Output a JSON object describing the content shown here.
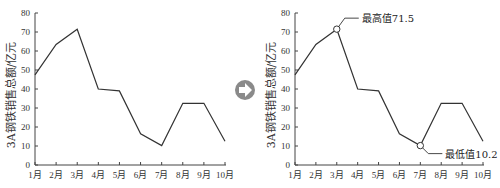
{
  "arrow_icon": {
    "name": "arrow-right-circle-icon",
    "color": "#8a8a8a"
  },
  "chart_data": [
    {
      "type": "line",
      "title": "",
      "xlabel": "",
      "ylabel": "3A钢铁销售总额/亿元",
      "categories": [
        "1月",
        "2月",
        "3月",
        "4月",
        "5月",
        "6月",
        "7月",
        "8月",
        "9月",
        "10月"
      ],
      "values": [
        47.5,
        63.5,
        71.5,
        40,
        39,
        16.5,
        10.2,
        32.5,
        32.5,
        12.5
      ],
      "yticks": [
        0,
        10,
        20,
        30,
        40,
        50,
        60,
        70,
        80
      ],
      "ylim": [
        0,
        80
      ],
      "grid": false,
      "line_color": "#333333",
      "annotations": []
    },
    {
      "type": "line",
      "title": "",
      "xlabel": "",
      "ylabel": "3A钢铁销售总额/亿元",
      "categories": [
        "1月",
        "2月",
        "3月",
        "4月",
        "5月",
        "6月",
        "7月",
        "8月",
        "9月",
        "10月"
      ],
      "values": [
        47.5,
        63.5,
        71.5,
        40,
        39,
        16.5,
        10.2,
        32.5,
        32.5,
        12.5
      ],
      "yticks": [
        0,
        10,
        20,
        30,
        40,
        50,
        60,
        70,
        80
      ],
      "ylim": [
        0,
        80
      ],
      "grid": false,
      "line_color": "#333333",
      "annotations": [
        {
          "label": "最高值71.5",
          "category": "3月",
          "value": 71.5,
          "marker": "hollow-circle"
        },
        {
          "label": "最低值10.2",
          "category": "7月",
          "value": 10.2,
          "marker": "hollow-circle"
        }
      ]
    }
  ]
}
